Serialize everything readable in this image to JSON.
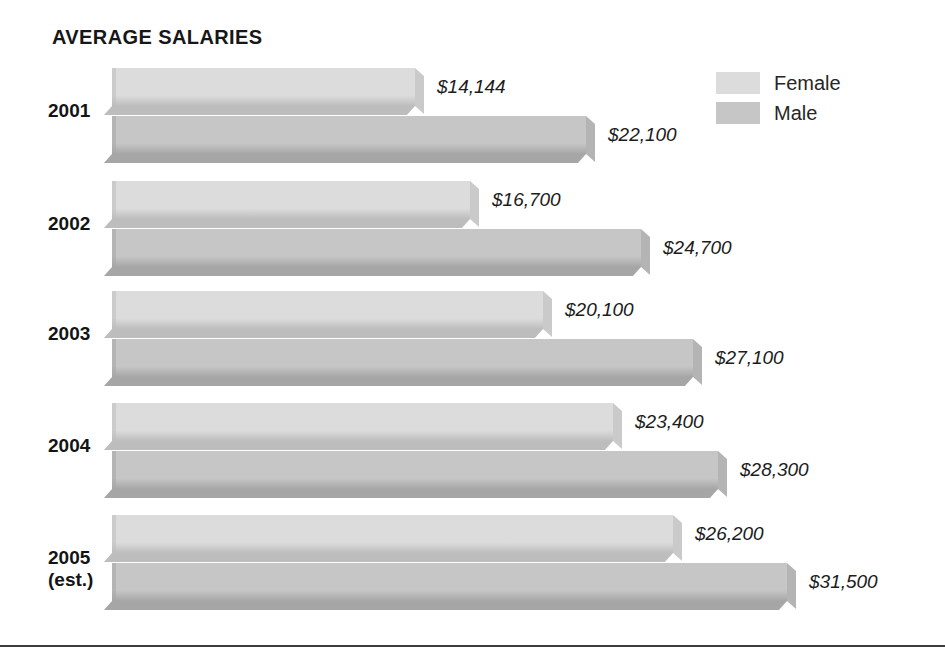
{
  "title": "AVERAGE SALARIES",
  "legend": {
    "position": "top-right",
    "entries": [
      {
        "label": "Female",
        "color": "#dcdcdc"
      },
      {
        "label": "Male",
        "color": "#c6c6c6"
      }
    ]
  },
  "colors": {
    "female_face": "#dcdcdc",
    "female_shade": "#bdbdbd",
    "female_cap": "#cacaca",
    "male_face": "#c6c6c6",
    "male_shade": "#a6a6a6",
    "male_cap": "#b4b4b4",
    "text": "#1a1a1a",
    "rule": "#3d3d3d",
    "background": "#ffffff"
  },
  "chart_data": {
    "type": "bar",
    "orientation": "horizontal",
    "title": "AVERAGE SALARIES",
    "xlabel": "",
    "ylabel": "",
    "grid": false,
    "legend_position": "top-right",
    "xlim": [
      0,
      31500
    ],
    "categories": [
      "2001",
      "2002",
      "2003",
      "2004",
      "2005 (est.)"
    ],
    "series": [
      {
        "name": "Female",
        "color": "#dcdcdc",
        "values": [
          14144,
          16700,
          20100,
          23400,
          26200
        ]
      },
      {
        "name": "Male",
        "color": "#c6c6c6",
        "values": [
          22100,
          24700,
          27100,
          28300,
          31500
        ]
      }
    ],
    "value_labels": [
      {
        "category": "2001",
        "series": "Female",
        "text": "$14,144"
      },
      {
        "category": "2001",
        "series": "Male",
        "text": "$22,100"
      },
      {
        "category": "2002",
        "series": "Female",
        "text": "$16,700"
      },
      {
        "category": "2002",
        "series": "Male",
        "text": "$24,700"
      },
      {
        "category": "2003",
        "series": "Female",
        "text": "$20,100"
      },
      {
        "category": "2003",
        "series": "Male",
        "text": "$27,100"
      },
      {
        "category": "2004",
        "series": "Female",
        "text": "$23,400"
      },
      {
        "category": "2004",
        "series": "Male",
        "text": "$28,300"
      },
      {
        "category": "2005 (est.)",
        "series": "Female",
        "text": "$26,200"
      },
      {
        "category": "2005 (est.)",
        "series": "Male",
        "text": "$31,500"
      }
    ]
  },
  "groups": [
    {
      "year": "2001",
      "year_sub": "",
      "bars": [
        {
          "series": "Female",
          "value": 14144,
          "label": "$14,144"
        },
        {
          "series": "Male",
          "value": 22100,
          "label": "$22,100"
        }
      ]
    },
    {
      "year": "2002",
      "year_sub": "",
      "bars": [
        {
          "series": "Female",
          "value": 16700,
          "label": "$16,700"
        },
        {
          "series": "Male",
          "value": 24700,
          "label": "$24,700"
        }
      ]
    },
    {
      "year": "2003",
      "year_sub": "",
      "bars": [
        {
          "series": "Female",
          "value": 20100,
          "label": "$20,100"
        },
        {
          "series": "Male",
          "value": 27100,
          "label": "$27,100"
        }
      ]
    },
    {
      "year": "2004",
      "year_sub": "",
      "bars": [
        {
          "series": "Female",
          "value": 23400,
          "label": "$23,400"
        },
        {
          "series": "Male",
          "value": 28300,
          "label": "$28,300"
        }
      ]
    },
    {
      "year": "2005",
      "year_sub": "(est.)",
      "bars": [
        {
          "series": "Female",
          "value": 26200,
          "label": "$26,200"
        },
        {
          "series": "Male",
          "value": 31500,
          "label": "$31,500"
        }
      ]
    }
  ],
  "layout": {
    "bar_origin_x": 112,
    "px_per_dollar": 0.02143,
    "bar_height": 38,
    "group_tops": [
      68,
      181,
      291,
      403,
      515
    ],
    "bar_gap": 48,
    "label_offset": 22
  }
}
